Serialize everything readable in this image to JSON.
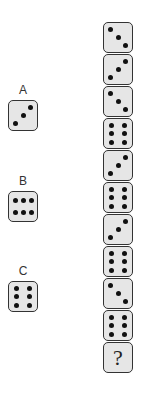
{
  "puzzle": {
    "column": [
      {
        "value": 3,
        "orientation": "diag-down"
      },
      {
        "value": 3,
        "orientation": "diag-up"
      },
      {
        "value": 3,
        "orientation": "diag-down"
      },
      {
        "value": 6,
        "orientation": "vertical"
      },
      {
        "value": 3,
        "orientation": "diag-up"
      },
      {
        "value": 6,
        "orientation": "vertical"
      },
      {
        "value": 3,
        "orientation": "diag-up"
      },
      {
        "value": 6,
        "orientation": "vertical"
      },
      {
        "value": 3,
        "orientation": "diag-down"
      },
      {
        "value": 6,
        "orientation": "vertical"
      },
      {
        "value": null,
        "label": "?"
      }
    ],
    "options": [
      {
        "label": "A",
        "value": 3,
        "orientation": "diag-up"
      },
      {
        "label": "B",
        "value": 6,
        "orientation": "horizontal"
      },
      {
        "label": "C",
        "value": 6,
        "orientation": "vertical"
      }
    ]
  },
  "colors": {
    "die_fill": "#e6e6e6",
    "die_border": "#333333",
    "pip": "#111111"
  }
}
